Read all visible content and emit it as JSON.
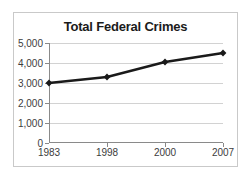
{
  "chart_data": {
    "type": "line",
    "title": "Total Federal Crimes",
    "xlabel": "",
    "ylabel": "",
    "categories": [
      "1983",
      "1998",
      "2000",
      "2007"
    ],
    "values": [
      3000,
      3300,
      4050,
      4500
    ],
    "series": [
      {
        "name": "Total Federal Crimes",
        "values": [
          3000,
          3300,
          4050,
          4500
        ]
      }
    ],
    "ylim": [
      0,
      5000
    ],
    "ytick_labels": [
      "0",
      "1,000",
      "2,000",
      "3,000",
      "4,000",
      "5,000"
    ],
    "ytick_values": [
      0,
      1000,
      2000,
      3000,
      4000,
      5000
    ],
    "xtick_labels": [
      "1983",
      "1998",
      "2000",
      "2007"
    ],
    "grid": true,
    "legend": false,
    "legend_position": "none",
    "marker": "diamond",
    "line_color": "#1a1a1a",
    "marker_color": "#1a1a1a",
    "grid_color": "#d2d2d2",
    "axis_color": "#8a8a8a",
    "title_color": "#1b1b1b",
    "background_color": "#ffffff",
    "frame_color": "#c9c9c9"
  }
}
